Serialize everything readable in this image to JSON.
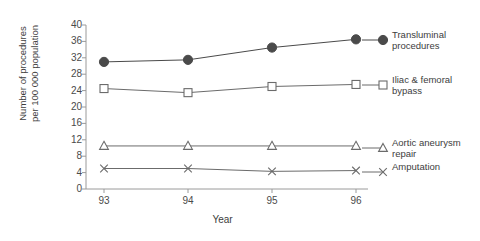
{
  "chart_data": {
    "type": "line",
    "title": "",
    "xlabel": "Year",
    "ylabel": "Number of procedures\nper 100 000 population",
    "categories": [
      "93",
      "94",
      "95",
      "96"
    ],
    "ylim": [
      0,
      40
    ],
    "ytick_labels": [
      "0",
      "4",
      "8",
      "12",
      "16",
      "20",
      "24",
      "28",
      "32",
      "36",
      "40"
    ],
    "ytick_values": [
      0,
      4,
      8,
      12,
      16,
      20,
      24,
      28,
      32,
      36,
      40
    ],
    "grid": false,
    "legend_position": "right",
    "series": [
      {
        "name": "Transluminal\nprocedures",
        "marker": "filled-circle",
        "color": "#4a4a4a",
        "values": [
          31.0,
          31.5,
          34.5,
          36.5
        ]
      },
      {
        "name": "Iliac & femoral\nbypass",
        "marker": "open-square",
        "color": "#6b6b6b",
        "values": [
          24.5,
          23.5,
          25.0,
          25.5
        ]
      },
      {
        "name": "Aortic aneurysm\nrepair",
        "marker": "open-triangle",
        "color": "#6b6b6b",
        "values": [
          10.5,
          10.5,
          10.5,
          10.5
        ]
      },
      {
        "name": "Amputation",
        "marker": "cross",
        "color": "#6b6b6b",
        "values": [
          5.0,
          5.0,
          4.3,
          4.5
        ]
      }
    ]
  },
  "axis": {
    "line_color": "#9a9a9a"
  }
}
